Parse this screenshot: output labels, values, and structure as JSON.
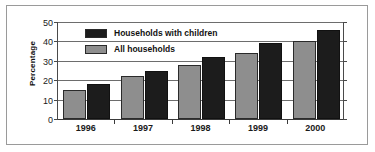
{
  "chart_data": {
    "type": "bar",
    "title": "",
    "xlabel": "",
    "ylabel": "Percentage",
    "categories": [
      "1996",
      "1997",
      "1998",
      "1999",
      "2000"
    ],
    "series": [
      {
        "name": "All households",
        "color": "#8e8e8e",
        "values": [
          15,
          22,
          28,
          34,
          40
        ]
      },
      {
        "name": "Households with children",
        "color": "#1c1c1c",
        "values": [
          18,
          25,
          32,
          39,
          46
        ]
      }
    ],
    "ylim": [
      0,
      50
    ],
    "yticks": [
      0,
      10,
      20,
      30,
      40,
      50
    ],
    "ytick_labels": [
      "0",
      "10",
      "20",
      "30",
      "40",
      "50"
    ],
    "grid": true,
    "legend_position": "top-left-inside",
    "legend_order": [
      "Households with children",
      "All households"
    ]
  },
  "legend": {
    "items": [
      {
        "label": "Households with children",
        "swatch": "dark"
      },
      {
        "label": "All households",
        "swatch": "gray"
      }
    ]
  },
  "axes": {
    "y_title": "Percentage"
  }
}
